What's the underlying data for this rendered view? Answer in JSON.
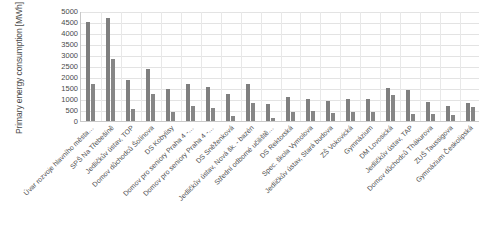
{
  "chart_data": {
    "type": "bar",
    "title": "",
    "xlabel": "",
    "ylabel": "Primary energy consumption [MWh]",
    "ylim": [
      0,
      5000
    ],
    "ytick_labels": [
      "5000",
      "4500",
      "4000",
      "3500",
      "3000",
      "2500",
      "2000",
      "1500",
      "1000",
      "500",
      "0"
    ],
    "ytick_values": [
      5000,
      4500,
      4000,
      3500,
      3000,
      2500,
      2000,
      1500,
      1000,
      500,
      0
    ],
    "grid": true,
    "legend": "none",
    "bar_color": "#7f7f7f",
    "categories": [
      "Úvar rozvoje hlavního města…",
      "SPŠ Na Třebešíně",
      "Jedličkův ústav, TOP",
      "Domov důchodců Šolínova",
      "DS Kobylisy",
      "Domov pro seniory Praha 4 -…",
      "Domov pro seniory Praha 4 -…",
      "DS Sněženková",
      "Jedličkův ústav, Nová šk. - bazén",
      "Střední odborné učiliště…",
      "DS Rektorská",
      "Spec. škola Vymolova",
      "Jedličkův ústav, Stará budova",
      "ZŠ Vokovická",
      "Gymnázium",
      "DM Lovosická",
      "Jedličkův ústav, TAP",
      "Domov důchodců Thákurova",
      "ZUŠ Taussigova",
      "Gymnázium Českolipská"
    ],
    "series": [
      {
        "name": "series-1",
        "values": [
          4500,
          4700,
          1850,
          2350,
          1450,
          1700,
          1550,
          1250,
          1700,
          780,
          1080,
          1020,
          900,
          980,
          1020,
          1480,
          1420,
          880,
          700,
          830
        ]
      },
      {
        "name": "series-2",
        "values": [
          1700,
          2800,
          550,
          1250,
          400,
          700,
          580,
          250,
          800,
          140,
          430,
          470,
          380,
          420,
          400,
          1180,
          300,
          330,
          260,
          620
        ]
      }
    ]
  }
}
